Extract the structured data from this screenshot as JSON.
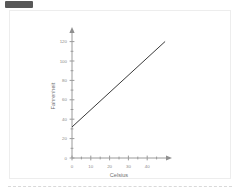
{
  "badge": {
    "label": ""
  },
  "chart_data": {
    "type": "line",
    "title": "",
    "xlabel": "Celsius",
    "ylabel": "Fahrenheit",
    "xlim": [
      0,
      50
    ],
    "ylim": [
      0,
      130
    ],
    "grid": false,
    "legend": null,
    "x_ticks": [
      0,
      10,
      20,
      30,
      40
    ],
    "x_tick_labels": [
      "0",
      "10",
      "20",
      "30",
      "40"
    ],
    "x_minor_step": 5,
    "y_ticks": [
      0,
      20,
      40,
      60,
      80,
      100,
      120
    ],
    "y_tick_labels": [
      "0",
      "20",
      "40",
      "60",
      "80",
      "100",
      "120"
    ],
    "y_minor_step": 10,
    "series": [
      {
        "name": "Fahrenheit = 1.8 x Celsius + 32",
        "color": "#3a3a3a",
        "x": [
          0,
          10,
          20,
          30,
          40,
          49
        ],
        "values": [
          32,
          50,
          68,
          86,
          104,
          120.2
        ]
      }
    ],
    "annotations": []
  }
}
